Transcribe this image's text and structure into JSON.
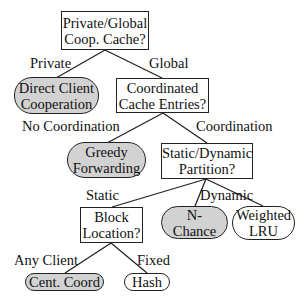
{
  "diagram": {
    "type": "decision-tree",
    "colors": {
      "leaf_gray": "#d2d2d2",
      "leaf_white": "#ffffff",
      "stroke": "#222222"
    },
    "nodes": {
      "root": {
        "line1": "Private/Global",
        "line2": "Coop. Cache?"
      },
      "direct": {
        "line1": "Direct Client",
        "line2": "Cooperation"
      },
      "coordinated": {
        "line1": "Coordinated",
        "line2": "Cache Entries?"
      },
      "greedy": {
        "line1": "Greedy",
        "line2": "Forwarding"
      },
      "partition": {
        "line1": "Static/Dynamic",
        "line2": "Partition?"
      },
      "block": {
        "line1": "Block",
        "line2": "Location?"
      },
      "nchance": {
        "line1": "N-",
        "line2": "Chance"
      },
      "weighted": {
        "line1": "Weighted",
        "line2": "LRU"
      },
      "cent": {
        "line1": "Cent. Coord"
      },
      "hash": {
        "line1": "Hash"
      }
    },
    "edge_labels": {
      "private": "Private",
      "global": "Global",
      "no_coordination": "No Coordination",
      "coordination": "Coordination",
      "static": "Static",
      "dynamic": "Dynamic",
      "any_client": "Any Client",
      "fixed": "Fixed"
    }
  }
}
